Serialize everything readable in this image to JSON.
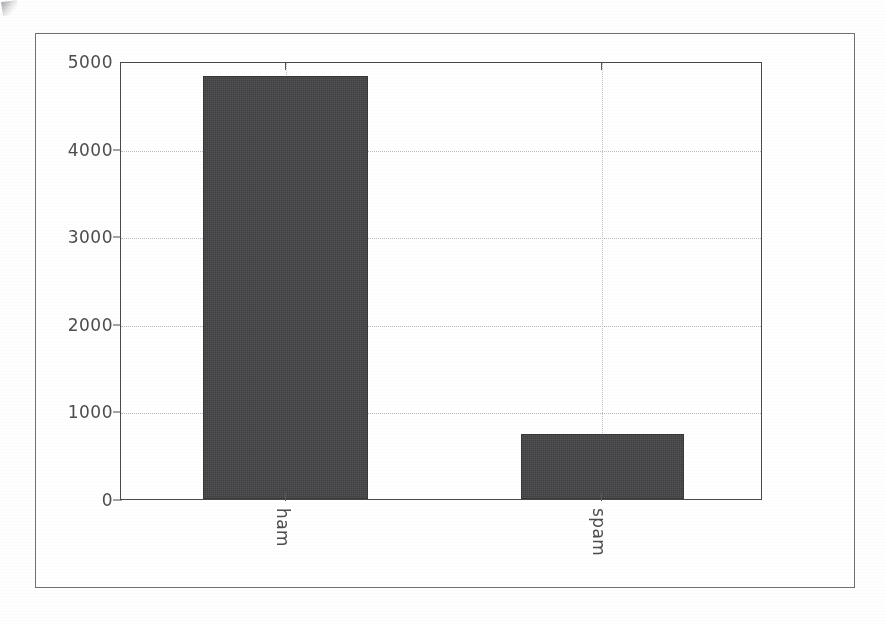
{
  "figure": {
    "frame_color": "#6f7072",
    "background": "#ffffff"
  },
  "chart_data": {
    "type": "bar",
    "title": "",
    "subtitle": "",
    "xlabel": "",
    "ylabel": "",
    "categories": [
      "ham",
      "spam"
    ],
    "values": [
      4825,
      745
    ],
    "series": [
      {
        "name": "count",
        "values": [
          4825,
          745
        ]
      }
    ],
    "ylim": [
      0,
      5000
    ],
    "y_ticks": [
      0,
      1000,
      2000,
      3000,
      4000,
      5000
    ],
    "y_tick_labels": [
      "0",
      "1000",
      "2000",
      "3000",
      "4000",
      "5000"
    ],
    "x_tick_labels": [
      "ham",
      "spam"
    ],
    "x_tick_label_rotation": 90,
    "grid": true,
    "grid_style": "dotted",
    "grid_axis": "both",
    "legend": null,
    "legend_position": "none",
    "bar_color": "#3f3f41",
    "bar_edge_color": "#37373a",
    "grid_color": "#b9b9bb",
    "axis_color": "#4a4a4c",
    "tick_label_color": "#4d4d4f",
    "annotations": []
  },
  "axes": {
    "y_tick_labels": [
      "5000",
      "4000",
      "3000",
      "2000",
      "1000",
      "0"
    ],
    "x_tick_labels": [
      "ham",
      "spam"
    ]
  }
}
